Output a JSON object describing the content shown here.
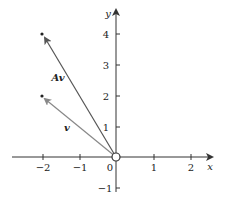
{
  "diagram": {
    "type": "vector-plot",
    "axes": {
      "x_label": "x",
      "y_label": "y",
      "x_ticks": [
        {
          "value": -2,
          "label": "−2"
        },
        {
          "value": -1,
          "label": "−1"
        },
        {
          "value": 0,
          "label": "0"
        },
        {
          "value": 1,
          "label": "1"
        },
        {
          "value": 2,
          "label": "2"
        }
      ],
      "y_ticks": [
        {
          "value": -1,
          "label": "−1"
        },
        {
          "value": 1,
          "label": "1"
        },
        {
          "value": 2,
          "label": "2"
        },
        {
          "value": 3,
          "label": "3"
        },
        {
          "value": 4,
          "label": "4"
        }
      ]
    },
    "vectors": [
      {
        "name": "v",
        "label": "v",
        "from": [
          0,
          0
        ],
        "to": [
          -2,
          2
        ],
        "color": "#888888"
      },
      {
        "name": "Av",
        "label": "Av",
        "from": [
          0,
          0
        ],
        "to": [
          -2,
          4
        ],
        "color": "#555555"
      }
    ],
    "origin_marker": "open-circle",
    "colors": {
      "axis": "#333333",
      "text": "#222222",
      "background": "#ffffff"
    }
  }
}
